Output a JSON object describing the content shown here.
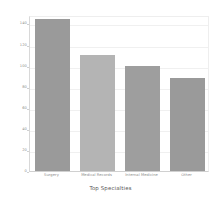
{
  "chart_data": {
    "type": "bar",
    "title": "",
    "xlabel": "Top Specialties",
    "ylabel": "",
    "categories": [
      "Surgery",
      "Medical Records",
      "Internal Medicine",
      "Other"
    ],
    "values": [
      144,
      110,
      100,
      88
    ],
    "series": [
      {
        "name": "Count",
        "values": [
          144,
          110,
          100,
          88
        ]
      }
    ],
    "bar_colors": [
      "#9a9a9a",
      "#b4b4b4",
      "#9e9e9e",
      "#9a9a9a"
    ],
    "ylim": [
      0,
      148
    ],
    "yticks": [
      0,
      20,
      40,
      60,
      80,
      100,
      120,
      140
    ],
    "ytick_labels": [
      "0",
      "20",
      "40",
      "60",
      "80",
      "100",
      "120",
      "140"
    ],
    "grid": true,
    "grid_axis": "y",
    "legend": false,
    "legend_position": "none",
    "background_color": "#ffffff",
    "grid_color": "#f0f0f0",
    "axis_color": "#d0d0d0",
    "tick_label_color": "#8d8d8d",
    "axis_title_color": "#555555"
  }
}
